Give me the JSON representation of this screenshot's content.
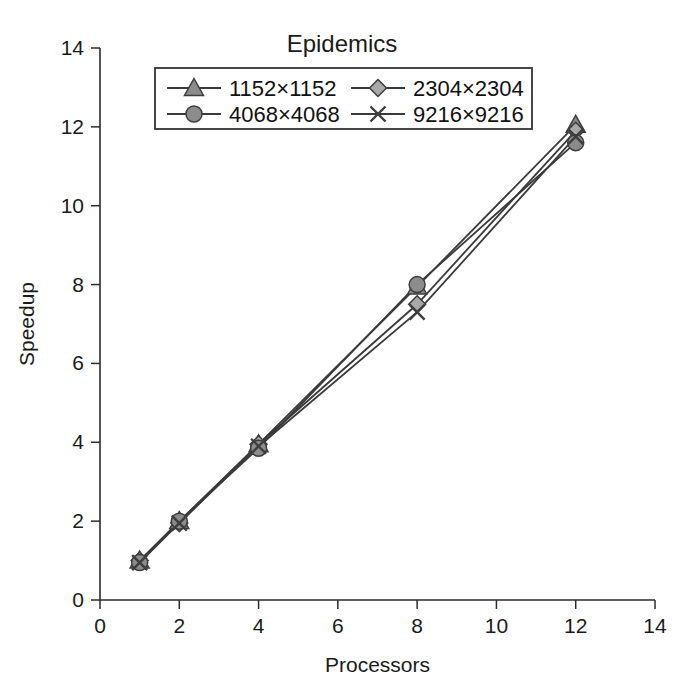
{
  "chart_data": {
    "type": "line",
    "title": "Epidemics",
    "xlabel": "Processors",
    "ylabel": "Speedup",
    "xlim": [
      0,
      14
    ],
    "ylim": [
      0,
      14
    ],
    "xticks": [
      0,
      2,
      4,
      6,
      8,
      10,
      12,
      14
    ],
    "yticks": [
      0,
      2,
      4,
      6,
      8,
      10,
      12,
      14
    ],
    "xtick_labels": [
      "0",
      "2",
      "4",
      "6",
      "8",
      "10",
      "12",
      "14"
    ],
    "ytick_labels": [
      "0",
      "2",
      "4",
      "6",
      "8",
      "10",
      "12",
      "14"
    ],
    "grid": false,
    "legend_position": "top-center",
    "x": [
      1,
      2,
      4,
      8,
      12
    ],
    "series": [
      {
        "name": "1152×1152",
        "marker": "triangle",
        "marker_fill": "#8c8c8c",
        "line_color": "#3a3a3a",
        "values": [
          1.0,
          2.0,
          3.95,
          7.95,
          12.05
        ]
      },
      {
        "name": "2304×2304",
        "marker": "diamond",
        "marker_fill": "#a8a8a8",
        "line_color": "#3a3a3a",
        "values": [
          1.0,
          1.95,
          3.95,
          7.5,
          11.9
        ]
      },
      {
        "name": "4068×4068",
        "marker": "circle",
        "marker_fill": "#8c8c8c",
        "line_color": "#3a3a3a",
        "values": [
          0.95,
          2.0,
          3.85,
          8.0,
          11.6
        ]
      },
      {
        "name": "9216×9216",
        "marker": "cross",
        "marker_fill": "#3d3d3d",
        "line_color": "#3a3a3a",
        "values": [
          0.95,
          1.95,
          3.9,
          7.3,
          11.75
        ]
      }
    ]
  },
  "legend": {
    "entries": [
      {
        "label": "1152×1152"
      },
      {
        "label": "2304×2304"
      },
      {
        "label": "4068×4068"
      },
      {
        "label": "9216×9216"
      }
    ]
  },
  "colors": {
    "axis": "#2b2b2b",
    "line": "#3a3a3a",
    "marker_light": "#a8a8a8",
    "marker_mid": "#8c8c8c",
    "marker_dark": "#3d3d3d",
    "background": "#ffffff"
  }
}
